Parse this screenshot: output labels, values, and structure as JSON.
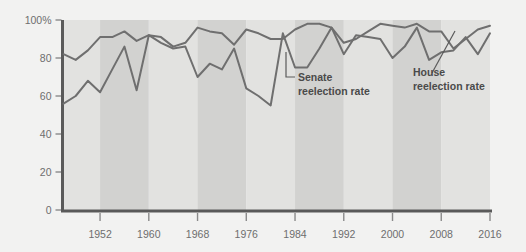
{
  "chart_data": {
    "type": "line",
    "title": "",
    "subtitle": "",
    "xlabel": "",
    "ylabel": "",
    "xlim": [
      1946,
      2016
    ],
    "ylim": [
      0,
      100
    ],
    "grid": false,
    "legend_position": "inline-annotations",
    "y_ticks": [
      0,
      20,
      40,
      60,
      80,
      100
    ],
    "y_tick_labels": [
      "0",
      "20",
      "40",
      "60",
      "80",
      "100%"
    ],
    "x_ticks": [
      1952,
      1960,
      1968,
      1976,
      1984,
      1992,
      2000,
      2008,
      2016
    ],
    "x_tick_labels": [
      "1952",
      "1960",
      "1968",
      "1976",
      "1984",
      "1992",
      "2000",
      "2008",
      "2016"
    ],
    "x": [
      1946,
      1948,
      1950,
      1952,
      1954,
      1956,
      1958,
      1960,
      1962,
      1964,
      1966,
      1968,
      1970,
      1972,
      1974,
      1976,
      1978,
      1980,
      1982,
      1984,
      1986,
      1988,
      1990,
      1992,
      1994,
      1996,
      1998,
      2000,
      2002,
      2004,
      2006,
      2008,
      2010,
      2012,
      2014,
      2016
    ],
    "series": [
      {
        "name": "House reelection rate",
        "color": "#6f6f6f",
        "values": [
          82,
          79,
          84,
          91,
          91,
          94,
          89,
          92,
          91,
          86,
          88,
          96,
          94,
          93,
          87,
          95,
          93,
          90,
          90,
          95,
          98,
          98,
          96,
          88,
          90,
          94,
          98,
          97,
          96,
          98,
          94,
          94,
          85,
          90,
          95,
          97
        ]
      },
      {
        "name": "Senate reelection rate",
        "color": "#6f6f6f",
        "values": [
          56,
          60,
          68,
          62,
          74,
          86,
          63,
          92,
          88,
          85,
          86,
          70,
          77,
          74,
          85,
          64,
          60,
          55,
          93,
          75,
          75,
          85,
          96,
          82,
          92,
          91,
          90,
          80,
          86,
          96,
          79,
          83,
          84,
          91,
          82,
          93
        ]
      }
    ],
    "annotations": [
      {
        "id": "senate-annotation",
        "line1": "Senate",
        "line2": "reelection rate"
      },
      {
        "id": "house-annotation",
        "line1": "House",
        "line2": "reelection rate"
      }
    ],
    "band_color_light": "#e2e2e0",
    "band_color_dark": "#d2d2d0",
    "axis_color": "#5a5a5a",
    "background": "#f2f2f1"
  }
}
